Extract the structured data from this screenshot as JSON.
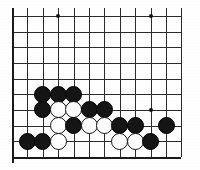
{
  "diagram": {
    "board_type": "go-board-partial"
  },
  "board": {
    "columns": 12,
    "rows": 10,
    "origin_x": 12,
    "origin_y": 16,
    "spacing_x": 15.4,
    "spacing_y": 15.65,
    "line_color": "#2b2b2b",
    "edge_color": "#1a1a1a",
    "background_color": "#ffffff",
    "left_edge_emphasized": true,
    "bottom_edge_emphasized": true
  },
  "star_points": [
    {
      "col": 3,
      "row": 0
    },
    {
      "col": 9,
      "row": 0
    },
    {
      "col": 9,
      "row": 6
    }
  ],
  "stone_colors": {
    "black": "#151515",
    "white": "#ffffff",
    "white_outline": "#151515"
  },
  "stones": [
    {
      "col": 2,
      "row": 5,
      "color": "black"
    },
    {
      "col": 3,
      "row": 5,
      "color": "black"
    },
    {
      "col": 4,
      "row": 5,
      "color": "black"
    },
    {
      "col": 2,
      "row": 6,
      "color": "black"
    },
    {
      "col": 3,
      "row": 6,
      "color": "white"
    },
    {
      "col": 4,
      "row": 6,
      "color": "white"
    },
    {
      "col": 5,
      "row": 6,
      "color": "black"
    },
    {
      "col": 6,
      "row": 6,
      "color": "black"
    },
    {
      "col": 3,
      "row": 7,
      "color": "white"
    },
    {
      "col": 4,
      "row": 7,
      "color": "black"
    },
    {
      "col": 5,
      "row": 7,
      "color": "white"
    },
    {
      "col": 6,
      "row": 7,
      "color": "white"
    },
    {
      "col": 7,
      "row": 7,
      "color": "black"
    },
    {
      "col": 8,
      "row": 7,
      "color": "black"
    },
    {
      "col": 10,
      "row": 7,
      "color": "black"
    },
    {
      "col": 1,
      "row": 8,
      "color": "black"
    },
    {
      "col": 2,
      "row": 8,
      "color": "black"
    },
    {
      "col": 3,
      "row": 8,
      "color": "white"
    },
    {
      "col": 7,
      "row": 8,
      "color": "white"
    },
    {
      "col": 8,
      "row": 8,
      "color": "white"
    },
    {
      "col": 9,
      "row": 8,
      "color": "black"
    }
  ],
  "counts": {
    "black_stones": 14,
    "white_stones": 7,
    "total_stones": 21
  }
}
